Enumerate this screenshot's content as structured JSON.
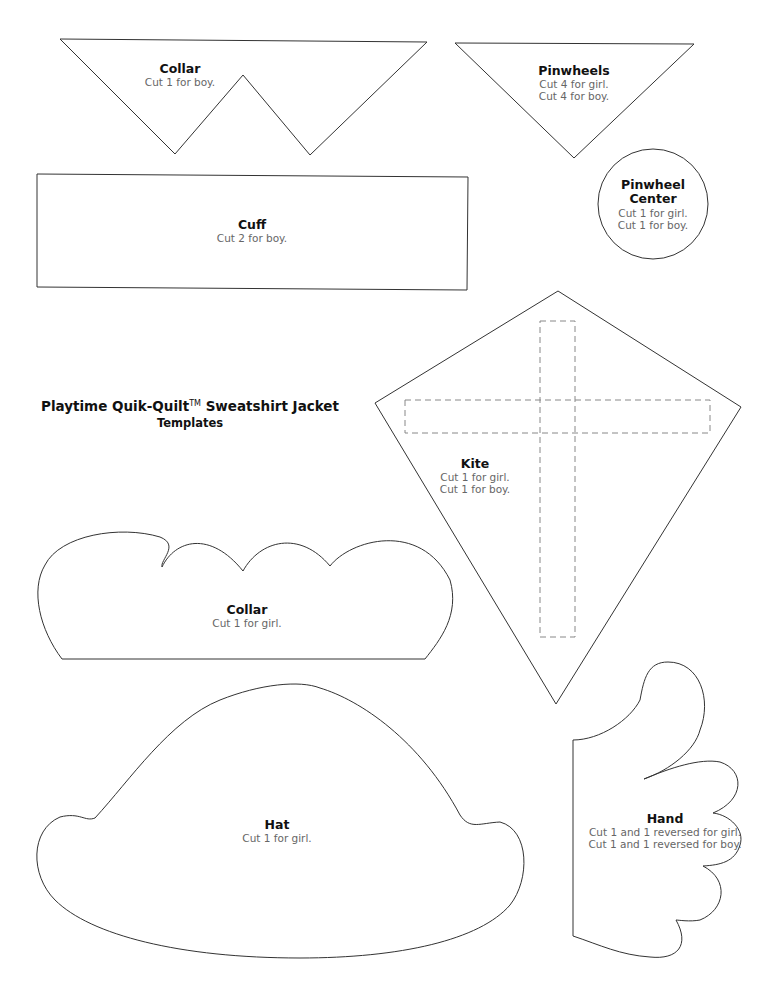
{
  "document": {
    "title": "Playtime Quik-Quilt",
    "trademark": "TM",
    "title_suffix": "Sweatshirt Jacket",
    "subtitle": "Templates"
  },
  "templates": {
    "collar_boy": {
      "name": "Collar",
      "instructions": [
        "Cut 1 for boy."
      ]
    },
    "pinwheels": {
      "name": "Pinwheels",
      "instructions": [
        "Cut 4 for girl.",
        "Cut 4 for boy."
      ]
    },
    "cuff": {
      "name": "Cuff",
      "instructions": [
        "Cut 2 for boy."
      ]
    },
    "pinwheel_center": {
      "name_line1": "Pinwheel",
      "name_line2": "Center",
      "instructions": [
        "Cut 1 for girl.",
        "Cut 1 for boy."
      ]
    },
    "kite": {
      "name": "Kite",
      "instructions": [
        "Cut 1 for girl.",
        "Cut 1 for boy."
      ]
    },
    "collar_girl": {
      "name": "Collar",
      "instructions": [
        "Cut 1 for girl."
      ]
    },
    "hat": {
      "name": "Hat",
      "instructions": [
        "Cut 1 for girl."
      ]
    },
    "hand": {
      "name": "Hand",
      "instructions": [
        "Cut 1 and 1 reversed for girl.",
        "Cut 1 and 1 reversed for boy."
      ]
    }
  },
  "colors": {
    "outline": "#333333",
    "title_text": "#111111",
    "instruction_text": "#666666",
    "dashed": "#888888"
  }
}
